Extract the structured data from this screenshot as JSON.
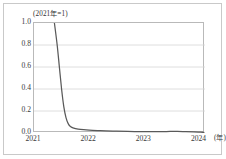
{
  "chart_data": {
    "type": "line",
    "title": "(2021年=1)",
    "xlabel": "(年)",
    "ylabel": "",
    "xlim": [
      2021.0,
      2024.1
    ],
    "ylim": [
      0.0,
      1.0
    ],
    "grid": true,
    "legend": false,
    "x_ticks": [
      "2021",
      "2022",
      "2023",
      "2024"
    ],
    "x_tick_values": [
      2021,
      2022,
      2023,
      2024
    ],
    "y_ticks": [
      "0.0",
      "0.2",
      "0.4",
      "0.6",
      "0.8",
      "1.0"
    ],
    "y_tick_values": [
      0.0,
      0.2,
      0.4,
      0.6,
      0.8,
      1.0
    ],
    "line_color": "#595959",
    "series": [
      {
        "name": "index",
        "x": [
          2021.37,
          2021.42,
          2021.46,
          2021.5,
          2021.54,
          2021.58,
          2021.62,
          2021.66,
          2021.72,
          2021.8,
          2021.9,
          2022.0,
          2022.15,
          2022.3,
          2022.5,
          2022.7,
          2022.9,
          2023.1,
          2023.25,
          2023.4,
          2023.5,
          2023.6,
          2023.75,
          2023.9,
          2024.0,
          2024.08
        ],
        "values": [
          1.0,
          0.8,
          0.6,
          0.4,
          0.24,
          0.14,
          0.085,
          0.06,
          0.045,
          0.036,
          0.03,
          0.026,
          0.022,
          0.019,
          0.016,
          0.014,
          0.013,
          0.012,
          0.012,
          0.013,
          0.014,
          0.014,
          0.013,
          0.011,
          0.008,
          0.005
        ]
      }
    ]
  }
}
